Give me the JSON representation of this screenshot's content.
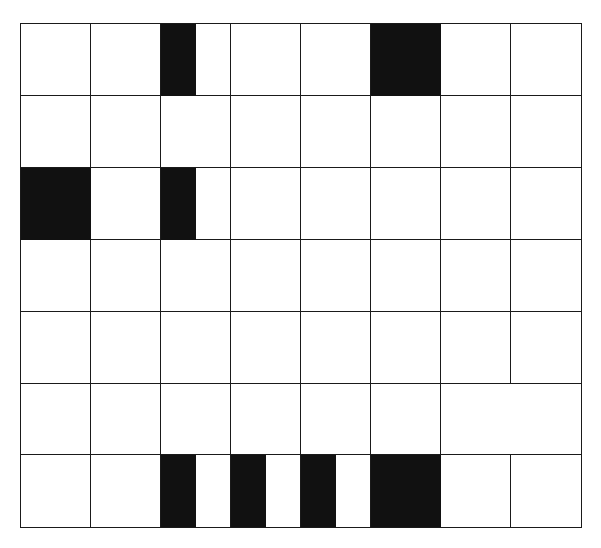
{
  "grid": {
    "cols": 8,
    "rows": 7,
    "left": 21,
    "top": 24,
    "cell_w": 70,
    "cell_h": 71.86,
    "line_color": "#1a1a1a",
    "fill_color": "#111111",
    "merged": [
      {
        "row": 5,
        "col": 6,
        "colspan": 2
      }
    ],
    "filled": [
      {
        "row": 0,
        "col": 2,
        "part": "left-half"
      },
      {
        "row": 0,
        "col": 5,
        "part": "full"
      },
      {
        "row": 2,
        "col": 0,
        "part": "full"
      },
      {
        "row": 2,
        "col": 2,
        "part": "left-half"
      },
      {
        "row": 6,
        "col": 2,
        "part": "left-half"
      },
      {
        "row": 6,
        "col": 3,
        "part": "left-half"
      },
      {
        "row": 6,
        "col": 4,
        "part": "left-half"
      },
      {
        "row": 6,
        "col": 5,
        "part": "full"
      }
    ]
  }
}
